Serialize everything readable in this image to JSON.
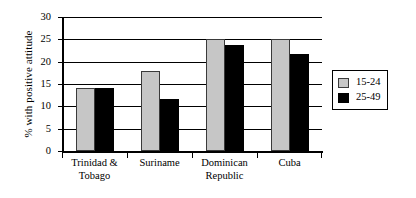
{
  "chart_data": {
    "type": "bar",
    "title": "",
    "xlabel": "",
    "ylabel": "% with positive attitude",
    "categories": [
      "Trinidad & Tobago",
      "Suriname",
      "Dominican Republic",
      "Cuba"
    ],
    "category_lines": [
      [
        "Trinidad &",
        "Tobago"
      ],
      [
        "Suriname"
      ],
      [
        "Dominican",
        "Republic"
      ],
      [
        "Cuba"
      ]
    ],
    "series": [
      {
        "name": "15-24",
        "color": "#c6c6c6",
        "values": [
          14,
          18,
          25,
          25
        ]
      },
      {
        "name": "25-49",
        "color": "#000000",
        "values": [
          14,
          11.7,
          23.8,
          21.7
        ]
      }
    ],
    "ylim": [
      0,
      30
    ],
    "yticks": [
      0,
      5,
      10,
      15,
      20,
      25,
      30
    ],
    "ytick_labels": [
      "0",
      "5",
      "10",
      "15",
      "20",
      "25",
      "30"
    ],
    "grid": true,
    "legend_position": "right"
  },
  "legend": {
    "entries": [
      {
        "label": "15-24"
      },
      {
        "label": "25-49"
      }
    ]
  }
}
